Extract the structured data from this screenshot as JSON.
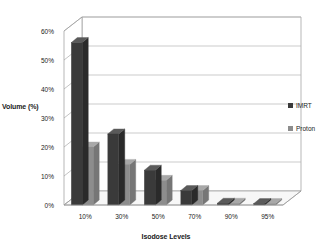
{
  "chart_data": {
    "type": "bar",
    "title": "",
    "subtitle": "",
    "xlabel": "Isodose Levels",
    "ylabel": "Volume (%)",
    "categories": [
      "10%",
      "30%",
      "50%",
      "70%",
      "90%",
      "95%"
    ],
    "series": [
      {
        "name": "IMRT",
        "color": "#3a3a3a",
        "values": [
          56,
          24.5,
          12,
          5,
          0.6,
          0.5
        ]
      },
      {
        "name": "Proton",
        "color": "#8d8d8d",
        "values": [
          20,
          14,
          8.5,
          5,
          0.6,
          0.5
        ]
      }
    ],
    "ylim": [
      0,
      60
    ],
    "yticks": [
      "0%",
      "10%",
      "20%",
      "30%",
      "40%",
      "50%",
      "60%"
    ],
    "ytick_values": [
      0,
      10,
      20,
      30,
      40,
      50,
      60
    ],
    "grid": true,
    "grid_axis": "y",
    "legend_position": "right",
    "three_d": true
  },
  "colors": {
    "imrt": "#3a3a3a",
    "imrt_top": "#5a5a5a",
    "imrt_side": "#2a2a2a",
    "proton": "#8d8d8d",
    "proton_top": "#a8a8a8",
    "proton_side": "#767676",
    "grid": "#b5b5b5",
    "axis": "#9a9a9a",
    "floor": "#f7f7f7",
    "wall": "#ffffff",
    "text": "#1a1a1a",
    "background": "#ffffff"
  },
  "legend": {
    "items": [
      {
        "label": "IMRT",
        "marker": "square-swatch-dark"
      },
      {
        "label": "Proton",
        "marker": "square-swatch-gray"
      }
    ]
  }
}
